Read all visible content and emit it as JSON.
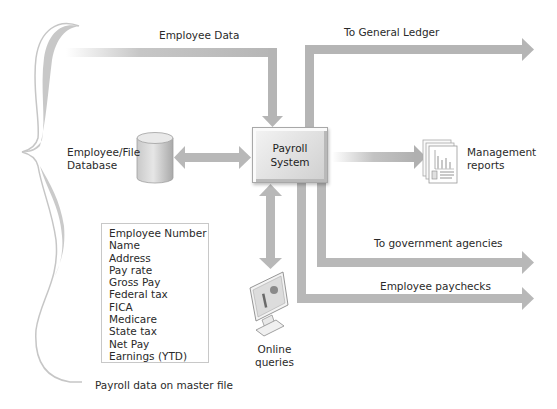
{
  "diagram": {
    "central_process": {
      "line1": "Payroll",
      "line2": "System"
    },
    "flows": {
      "employee_data": "Employee Data",
      "to_general_ledger": "To General Ledger",
      "to_government_agencies": "To government agencies",
      "employee_paychecks": "Employee paychecks"
    },
    "database": {
      "line1": "Employee/File",
      "line2": "Database"
    },
    "management_reports": {
      "line1": "Management",
      "line2": "reports"
    },
    "online_queries": {
      "line1": "Online",
      "line2": "queries"
    },
    "master_file": {
      "caption": "Payroll data on master file",
      "fields": [
        "Employee Number",
        "Name",
        "Address",
        "Pay rate",
        "Gross Pay",
        "Federal tax",
        "FICA",
        "Medicare",
        "State tax",
        "Net Pay",
        "Earnings (YTD)"
      ]
    },
    "colors": {
      "arrow": "#b8b8b8",
      "brace": "#c4c4c4",
      "box_border": "#a8a8a8"
    }
  }
}
